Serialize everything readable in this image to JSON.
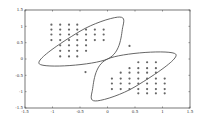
{
  "chart_data": {
    "type": "scatter",
    "title": "",
    "xlabel": "",
    "ylabel": "",
    "xlim": [
      -1.5,
      1.5
    ],
    "ylim": [
      -1.5,
      1.5
    ],
    "grid": false,
    "legend": null,
    "xticks": [
      "-1.5",
      "-1",
      "-0.5",
      "0",
      "0.5",
      "1",
      "1.5"
    ],
    "yticks": [
      "1.5",
      "1",
      "0.5",
      "0",
      "-0.5",
      "-1",
      "-1.5"
    ],
    "series": [
      {
        "name": "cluster-upper-left",
        "marker": "dot",
        "points": [
          [
            -1.02,
            1.05
          ],
          [
            -0.86,
            1.05
          ],
          [
            -0.7,
            1.05
          ],
          [
            -0.55,
            1.05
          ],
          [
            -1.02,
            0.9
          ],
          [
            -0.86,
            0.9
          ],
          [
            -0.7,
            0.9
          ],
          [
            -0.55,
            0.9
          ],
          [
            -0.39,
            0.9
          ],
          [
            -0.23,
            0.9
          ],
          [
            -0.07,
            0.9
          ],
          [
            -1.02,
            0.75
          ],
          [
            -0.86,
            0.75
          ],
          [
            -0.7,
            0.75
          ],
          [
            -0.55,
            0.75
          ],
          [
            -0.39,
            0.75
          ],
          [
            -0.23,
            0.75
          ],
          [
            -0.07,
            0.75
          ],
          [
            -1.02,
            0.58
          ],
          [
            -0.86,
            0.58
          ],
          [
            -0.7,
            0.58
          ],
          [
            -0.55,
            0.58
          ],
          [
            -0.39,
            0.58
          ],
          [
            -0.23,
            0.58
          ],
          [
            -0.07,
            0.58
          ],
          [
            -0.86,
            0.42
          ],
          [
            -0.7,
            0.42
          ],
          [
            -0.55,
            0.42
          ],
          [
            -0.39,
            0.42
          ],
          [
            -0.86,
            0.25
          ],
          [
            -0.7,
            0.25
          ],
          [
            -0.55,
            0.25
          ],
          [
            -0.39,
            0.25
          ],
          [
            -0.86,
            0.08
          ],
          [
            -0.7,
            0.08
          ],
          [
            -0.55,
            0.08
          ]
        ]
      },
      {
        "name": "cluster-lower-right",
        "marker": "dot",
        "points": [
          [
            0.56,
            -0.1
          ],
          [
            0.72,
            -0.1
          ],
          [
            0.88,
            -0.1
          ],
          [
            0.4,
            -0.28
          ],
          [
            0.56,
            -0.28
          ],
          [
            0.72,
            -0.28
          ],
          [
            0.88,
            -0.28
          ],
          [
            0.24,
            -0.42
          ],
          [
            0.4,
            -0.42
          ],
          [
            0.56,
            -0.42
          ],
          [
            0.72,
            -0.42
          ],
          [
            0.88,
            -0.42
          ],
          [
            0.08,
            -0.6
          ],
          [
            0.24,
            -0.6
          ],
          [
            0.4,
            -0.6
          ],
          [
            0.56,
            -0.6
          ],
          [
            0.72,
            -0.6
          ],
          [
            0.88,
            -0.6
          ],
          [
            1.04,
            -0.6
          ],
          [
            0.08,
            -0.75
          ],
          [
            0.24,
            -0.75
          ],
          [
            0.4,
            -0.75
          ],
          [
            0.56,
            -0.75
          ],
          [
            0.72,
            -0.75
          ],
          [
            0.88,
            -0.75
          ],
          [
            1.04,
            -0.75
          ],
          [
            0.08,
            -0.92
          ],
          [
            0.24,
            -0.92
          ],
          [
            0.4,
            -0.92
          ],
          [
            0.56,
            -0.92
          ],
          [
            0.72,
            -0.92
          ],
          [
            0.88,
            -0.92
          ],
          [
            1.04,
            -0.92
          ],
          [
            0.56,
            -1.05
          ],
          [
            0.72,
            -1.05
          ],
          [
            0.88,
            -1.05
          ],
          [
            1.04,
            -1.05
          ]
        ]
      },
      {
        "name": "outliers",
        "marker": "dot",
        "points": [
          [
            0.4,
            0.4
          ],
          [
            -0.4,
            -0.4
          ]
        ]
      }
    ],
    "curves": [
      {
        "name": "boundary-upper-left",
        "shape": "closed-lens",
        "passes_through": [
          [
            -1.24,
            -0.15
          ],
          [
            0.0,
            0.0
          ],
          [
            0.28,
            1.0
          ],
          [
            0.18,
            1.28
          ],
          [
            -0.5,
            0.85
          ]
        ]
      },
      {
        "name": "boundary-lower-right",
        "shape": "closed-lens",
        "passes_through": [
          [
            1.24,
            0.15
          ],
          [
            0.0,
            0.0
          ],
          [
            -0.28,
            -1.0
          ],
          [
            -0.18,
            -1.28
          ],
          [
            0.5,
            -0.85
          ]
        ]
      }
    ]
  }
}
